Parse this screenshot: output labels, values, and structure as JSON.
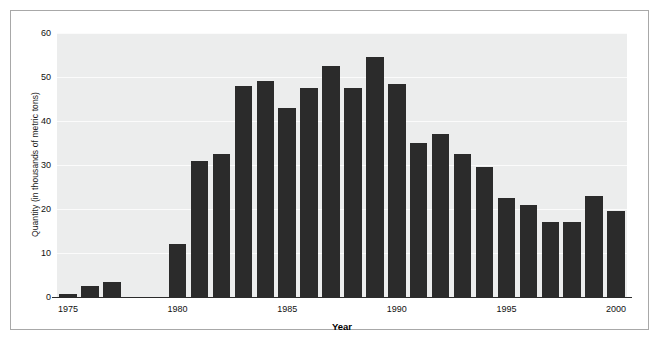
{
  "chart_data": {
    "type": "bar",
    "title": "",
    "xlabel": "Year",
    "ylabel": "Quantity (in thousands of metric tons)",
    "categories": [
      "1975",
      "1976",
      "1977",
      "1978",
      "1979",
      "1980",
      "1981",
      "1982",
      "1983",
      "1984",
      "1985",
      "1986",
      "1987",
      "1988",
      "1989",
      "1990",
      "1991",
      "1992",
      "1993",
      "1994",
      "1995",
      "1996",
      "1997",
      "1998",
      "1999",
      "2000"
    ],
    "values": [
      0.7,
      2.5,
      3.5,
      0,
      0,
      12,
      31,
      32.5,
      48,
      49,
      43,
      47.5,
      52.5,
      47.5,
      54.5,
      48.5,
      35,
      37,
      32.5,
      29.5,
      22.5,
      21,
      17,
      17,
      23,
      19.5
    ],
    "xtick_labels": [
      "1975",
      "1980",
      "1985",
      "1990",
      "1995",
      "2000"
    ],
    "xtick_values": [
      1975,
      1980,
      1985,
      1990,
      1995,
      2000
    ],
    "ytick_labels": [
      "0",
      "10",
      "20",
      "30",
      "40",
      "50",
      "60"
    ],
    "ytick_values": [
      0,
      10,
      20,
      30,
      40,
      50,
      60
    ],
    "ylim": [
      0,
      60
    ],
    "xlim": [
      1974.5,
      2000.5
    ],
    "grid": true,
    "legend": false,
    "bar_color": "#2b2b2b",
    "plot_background": "#eceded",
    "gridline_color": "#fbfbfb",
    "figure_background": "#ffffff",
    "frame_color": "#a8a8a8"
  }
}
